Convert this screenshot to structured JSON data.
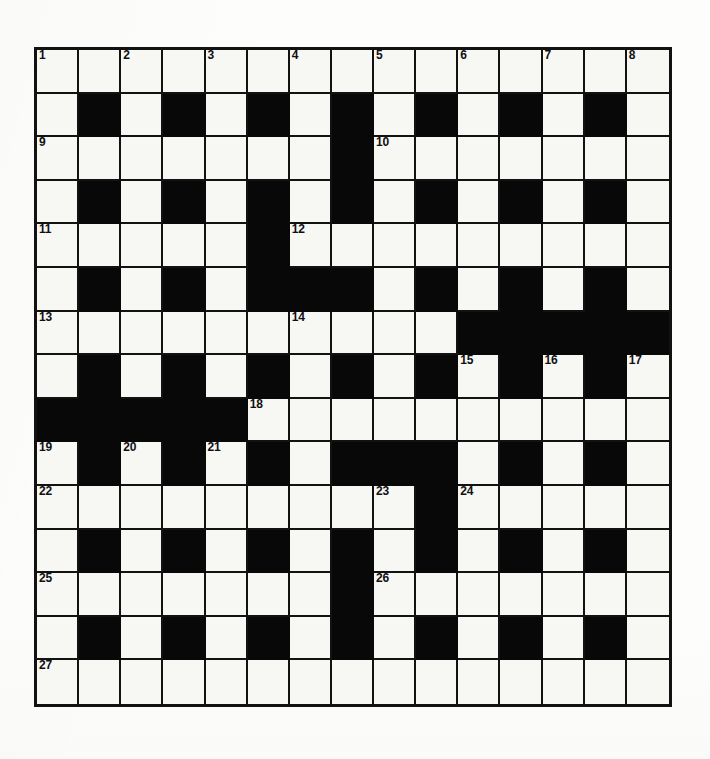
{
  "puzzle": {
    "title": "Crossword Grid",
    "type": "crossword",
    "columns": 15,
    "rows": 15,
    "colors": {
      "paper": "#fdfdfb",
      "cell_fill": "#f7f7f4",
      "block_fill": "#080808",
      "grid_line": "#121212",
      "number_text": "#101010"
    },
    "legend": {
      "white_cell": "open-letter-square",
      "black_cell": "block-square"
    },
    "grid": [
      [
        "w",
        "w",
        "w",
        "w",
        "w",
        "w",
        "w",
        "w",
        "w",
        "w",
        "w",
        "w",
        "w",
        "w",
        "w"
      ],
      [
        "w",
        "b",
        "w",
        "b",
        "w",
        "b",
        "w",
        "b",
        "w",
        "b",
        "w",
        "b",
        "w",
        "b",
        "w"
      ],
      [
        "w",
        "w",
        "w",
        "w",
        "w",
        "w",
        "w",
        "b",
        "w",
        "w",
        "w",
        "w",
        "w",
        "w",
        "w"
      ],
      [
        "w",
        "b",
        "w",
        "b",
        "w",
        "b",
        "w",
        "b",
        "w",
        "b",
        "w",
        "b",
        "w",
        "b",
        "w"
      ],
      [
        "w",
        "w",
        "w",
        "w",
        "w",
        "b",
        "w",
        "w",
        "w",
        "w",
        "w",
        "w",
        "w",
        "w",
        "w"
      ],
      [
        "w",
        "b",
        "w",
        "b",
        "w",
        "b",
        "b",
        "b",
        "w",
        "b",
        "w",
        "b",
        "w",
        "b",
        "w"
      ],
      [
        "w",
        "w",
        "w",
        "w",
        "w",
        "w",
        "w",
        "w",
        "w",
        "w",
        "b",
        "b",
        "b",
        "b",
        "b"
      ],
      [
        "w",
        "b",
        "w",
        "b",
        "w",
        "b",
        "w",
        "b",
        "w",
        "b",
        "w",
        "b",
        "w",
        "b",
        "w"
      ],
      [
        "b",
        "b",
        "b",
        "b",
        "b",
        "w",
        "w",
        "w",
        "w",
        "w",
        "w",
        "w",
        "w",
        "w",
        "w"
      ],
      [
        "w",
        "b",
        "w",
        "b",
        "w",
        "b",
        "w",
        "b",
        "b",
        "b",
        "w",
        "b",
        "w",
        "b",
        "w"
      ],
      [
        "w",
        "w",
        "w",
        "w",
        "w",
        "w",
        "w",
        "w",
        "w",
        "b",
        "w",
        "w",
        "w",
        "w",
        "w"
      ],
      [
        "w",
        "b",
        "w",
        "b",
        "w",
        "b",
        "w",
        "b",
        "w",
        "b",
        "w",
        "b",
        "w",
        "b",
        "w"
      ],
      [
        "w",
        "w",
        "w",
        "w",
        "w",
        "w",
        "w",
        "b",
        "w",
        "w",
        "w",
        "w",
        "w",
        "w",
        "w"
      ],
      [
        "w",
        "b",
        "w",
        "b",
        "w",
        "b",
        "w",
        "b",
        "w",
        "b",
        "w",
        "b",
        "w",
        "b",
        "w"
      ],
      [
        "w",
        "w",
        "w",
        "w",
        "w",
        "w",
        "w",
        "w",
        "w",
        "w",
        "w",
        "w",
        "w",
        "w",
        "w"
      ]
    ],
    "numbers": [
      {
        "n": "1",
        "row": 0,
        "col": 0
      },
      {
        "n": "2",
        "row": 0,
        "col": 2
      },
      {
        "n": "3",
        "row": 0,
        "col": 4
      },
      {
        "n": "4",
        "row": 0,
        "col": 6
      },
      {
        "n": "5",
        "row": 0,
        "col": 8
      },
      {
        "n": "6",
        "row": 0,
        "col": 10
      },
      {
        "n": "7",
        "row": 0,
        "col": 12
      },
      {
        "n": "8",
        "row": 0,
        "col": 14
      },
      {
        "n": "9",
        "row": 2,
        "col": 0
      },
      {
        "n": "10",
        "row": 2,
        "col": 8
      },
      {
        "n": "11",
        "row": 4,
        "col": 0
      },
      {
        "n": "12",
        "row": 4,
        "col": 6
      },
      {
        "n": "13",
        "row": 6,
        "col": 0
      },
      {
        "n": "14",
        "row": 6,
        "col": 6
      },
      {
        "n": "15",
        "row": 7,
        "col": 10
      },
      {
        "n": "16",
        "row": 7,
        "col": 12
      },
      {
        "n": "17",
        "row": 7,
        "col": 14
      },
      {
        "n": "18",
        "row": 8,
        "col": 5
      },
      {
        "n": "19",
        "row": 9,
        "col": 0
      },
      {
        "n": "20",
        "row": 9,
        "col": 2
      },
      {
        "n": "21",
        "row": 9,
        "col": 4
      },
      {
        "n": "22",
        "row": 10,
        "col": 0
      },
      {
        "n": "23",
        "row": 10,
        "col": 8
      },
      {
        "n": "24",
        "row": 10,
        "col": 10
      },
      {
        "n": "25",
        "row": 12,
        "col": 0
      },
      {
        "n": "26",
        "row": 12,
        "col": 8
      },
      {
        "n": "27",
        "row": 14,
        "col": 0
      }
    ]
  }
}
